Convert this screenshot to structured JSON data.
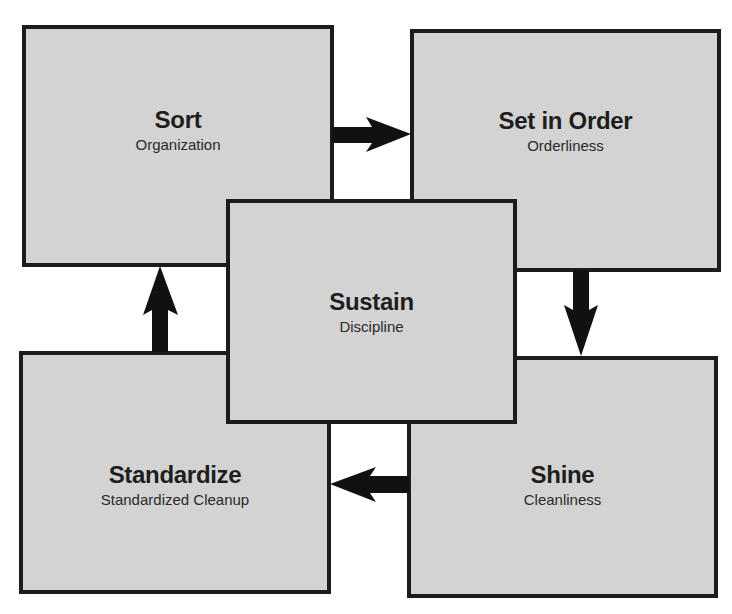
{
  "diagram": {
    "type": "5S cycle",
    "colors": {
      "box_fill": "#d3d3d3",
      "box_border": "#1c1c1c",
      "arrow": "#111111",
      "background": "#ffffff"
    },
    "steps": {
      "sort": {
        "title": "Sort",
        "subtitle": "Organization"
      },
      "set_in_order": {
        "title": "Set in Order",
        "subtitle": "Orderliness"
      },
      "shine": {
        "title": "Shine",
        "subtitle": "Cleanliness"
      },
      "standardize": {
        "title": "Standardize",
        "subtitle": "Standardized Cleanup"
      },
      "sustain": {
        "title": "Sustain",
        "subtitle": "Discipline"
      }
    },
    "arrows": [
      {
        "from": "Sort",
        "to": "Set in Order",
        "direction": "right"
      },
      {
        "from": "Set in Order",
        "to": "Shine",
        "direction": "down"
      },
      {
        "from": "Shine",
        "to": "Standardize",
        "direction": "left"
      },
      {
        "from": "Standardize",
        "to": "Sort",
        "direction": "up"
      }
    ]
  }
}
